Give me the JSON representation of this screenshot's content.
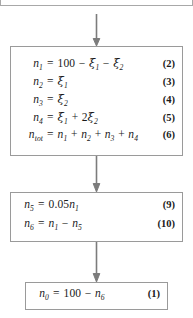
{
  "diagram": {
    "line_color": "#9a9a9a",
    "arrow_color": "#7c7c7c",
    "text_color": "#1a1a1a"
  },
  "top_partial_box": {
    "ghost_text": "ξ₁    ξ₂"
  },
  "boxes": [
    {
      "name": "species-balance-box",
      "equations": [
        {
          "lhs": "n",
          "lhs_sub": "1",
          "rhs": "100 − ξ₁ − ξ₂",
          "tag": "(2)"
        },
        {
          "lhs": "n",
          "lhs_sub": "2",
          "rhs": "ξ₁",
          "tag": "(3)"
        },
        {
          "lhs": "n",
          "lhs_sub": "3",
          "rhs": "ξ₂",
          "tag": "(4)"
        },
        {
          "lhs": "n",
          "lhs_sub": "4",
          "rhs": "ξ₁ + 2ξ₂",
          "tag": "(5)"
        },
        {
          "lhs": "n",
          "lhs_sub": "tot",
          "rhs": "n₁ + n₂ + n₃ + n₄",
          "tag": "(6)"
        }
      ]
    },
    {
      "name": "reduction-box",
      "equations": [
        {
          "lhs": "n",
          "lhs_sub": "5",
          "rhs": "0.05n₁",
          "tag": "(9)"
        },
        {
          "lhs": "n",
          "lhs_sub": "6",
          "rhs": "n₁ − n₅",
          "tag": "(10)"
        }
      ]
    },
    {
      "name": "initial-amount-box",
      "equations": [
        {
          "lhs": "n",
          "lhs_sub": "0",
          "rhs": "100 − n₆",
          "tag": "(1)"
        }
      ]
    }
  ],
  "arrows": [
    {
      "name": "arrow-top-to-species-balance",
      "direction": "down"
    },
    {
      "name": "arrow-species-balance-to-reduction",
      "direction": "down"
    },
    {
      "name": "arrow-reduction-to-initial",
      "direction": "down"
    }
  ]
}
